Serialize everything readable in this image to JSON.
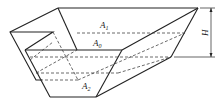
{
  "diagram": {
    "type": "3D hopper / frustum sketch",
    "labels": {
      "a1": "A",
      "a1_sub": "1",
      "a0": "A",
      "a0_sub": "0",
      "a2": "A",
      "a2_sub": "2",
      "height": "H"
    }
  }
}
